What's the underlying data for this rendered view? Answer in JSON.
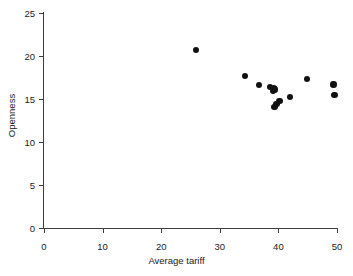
{
  "chart_data": {
    "type": "scatter",
    "title": "",
    "xlabel": "Average tariff",
    "ylabel": "Openness",
    "xlim": [
      0,
      50
    ],
    "ylim": [
      0,
      25
    ],
    "xticks": [
      0,
      10,
      20,
      30,
      40,
      50
    ],
    "yticks": [
      0,
      5,
      10,
      15,
      20,
      25
    ],
    "xtick_labels": [
      "0",
      "10",
      "20",
      "30",
      "40",
      "50"
    ],
    "ytick_labels": [
      "0",
      "5",
      "10",
      "15",
      "20",
      "25"
    ],
    "grid": false,
    "legend": null,
    "marker": {
      "shape": "circle",
      "color": "#111111",
      "size": 6.4
    },
    "series": [
      {
        "name": "countries",
        "points": [
          {
            "x": 25.9,
            "y": 20.7
          },
          {
            "x": 34.3,
            "y": 17.7
          },
          {
            "x": 36.7,
            "y": 16.6
          },
          {
            "x": 38.6,
            "y": 16.4
          },
          {
            "x": 39.2,
            "y": 16.3
          },
          {
            "x": 39.1,
            "y": 15.9
          },
          {
            "x": 39.4,
            "y": 16.1
          },
          {
            "x": 39.3,
            "y": 14.1
          },
          {
            "x": 39.7,
            "y": 14.4
          },
          {
            "x": 40.2,
            "y": 14.8
          },
          {
            "x": 42.0,
            "y": 15.2
          },
          {
            "x": 44.9,
            "y": 17.3
          },
          {
            "x": 49.4,
            "y": 16.7
          },
          {
            "x": 49.6,
            "y": 15.5
          }
        ]
      }
    ]
  }
}
